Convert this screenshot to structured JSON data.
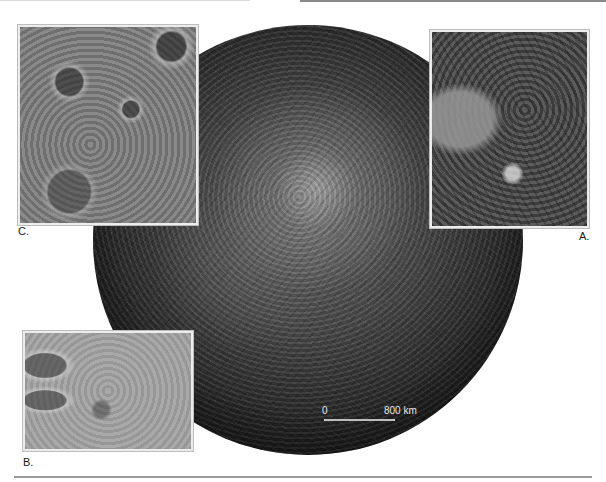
{
  "figure": {
    "insets": [
      {
        "id": "C",
        "label": "C."
      },
      {
        "id": "A",
        "label": "A."
      },
      {
        "id": "B",
        "label": "B."
      }
    ],
    "scale_bar": {
      "start_label": "0",
      "end_label": "800 km"
    }
  },
  "colors": {
    "background": "#ffffff",
    "label_text": "#1a1a1a",
    "scale_text": "#e8e8e8",
    "rule": "#9a9a9a"
  }
}
